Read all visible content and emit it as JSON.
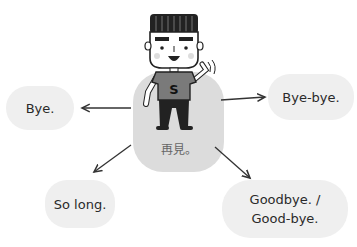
{
  "center": {
    "label": "再見。",
    "character": "waving-boy-icon",
    "shirt_letter": "S"
  },
  "phrases": [
    {
      "id": "bye",
      "text": "Bye."
    },
    {
      "id": "bye-bye",
      "text": "Bye-bye."
    },
    {
      "id": "so-long",
      "text": "So long."
    },
    {
      "id": "goodbye-line1",
      "text": "Goodbye. /"
    },
    {
      "id": "goodbye-line2",
      "text": "Good-bye."
    }
  ],
  "colors": {
    "bubble": "#efefef",
    "center_bubble": "#dcdcdc",
    "text": "#2a2a2a",
    "shirt": "#7a7a7a"
  }
}
